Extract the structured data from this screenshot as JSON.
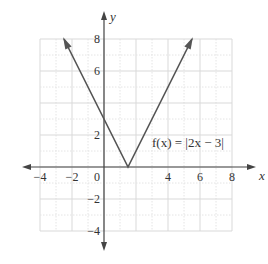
{
  "chart_data": {
    "type": "line",
    "title": "",
    "function_label": "f(x) = |2x − 3|",
    "xlabel": "x",
    "ylabel": "y",
    "xlim": [
      -4,
      8
    ],
    "ylim": [
      -4,
      8
    ],
    "x_ticks": [
      -4,
      -2,
      0,
      2,
      4,
      6,
      8
    ],
    "x_tick_labels": [
      "−4",
      "−2",
      "0",
      "",
      "4",
      "6",
      "8"
    ],
    "y_ticks": [
      -4,
      -2,
      2,
      6,
      8
    ],
    "y_tick_labels": [
      "−4",
      "−2",
      "2",
      "6",
      "8"
    ],
    "grid": true,
    "grid_major_step": 2,
    "grid_minor_step": 1,
    "series": [
      {
        "name": "f(x) = |2x − 3|",
        "x": [
          -2.5,
          1.5,
          5.5
        ],
        "y": [
          8,
          0,
          8
        ],
        "arrows_at_ends": true
      }
    ],
    "key_points": {
      "vertex": [
        1.5,
        0
      ],
      "y_intercept": [
        0,
        3
      ]
    }
  },
  "colors": {
    "axis": "#444444",
    "line": "#555555",
    "grid_major": "#d9d9d9",
    "grid_minor": "#e4e4e4",
    "text": "#333333"
  }
}
